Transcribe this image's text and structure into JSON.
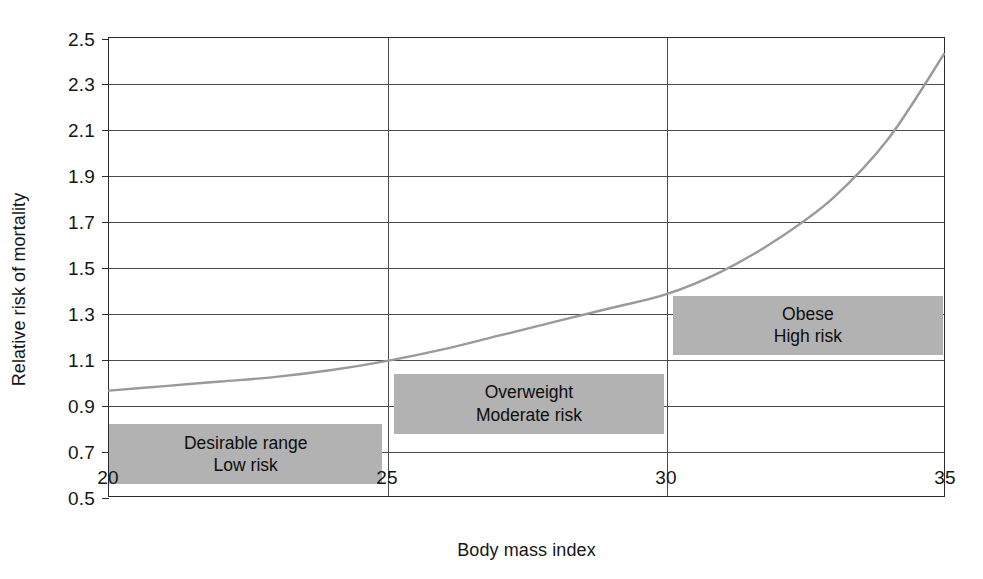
{
  "chart_data": {
    "type": "line",
    "title": "",
    "subtitle": "",
    "xlabel": "Body mass index",
    "ylabel": "Relative risk of mortality",
    "xlim": [
      20,
      35
    ],
    "ylim": [
      0.5,
      2.5
    ],
    "xticks": [
      20,
      25,
      30,
      35
    ],
    "xtick_labels": [
      "20",
      "25",
      "30",
      "35"
    ],
    "yticks": [
      0.5,
      0.7,
      0.9,
      1.1,
      1.3,
      1.5,
      1.7,
      1.9,
      2.1,
      2.3,
      2.5
    ],
    "ytick_labels": [
      "0.5",
      "0.7",
      "0.9",
      "1.1",
      "1.3",
      "1.5",
      "1.7",
      "1.9",
      "2.1",
      "2.3",
      "2.5"
    ],
    "grid": {
      "horizontal": true,
      "vertical_at": [
        25,
        30
      ],
      "color": "#4a4a4a"
    },
    "legend": null,
    "series": [
      {
        "name": "Relative risk of mortality",
        "color": "#9a9a9a",
        "line_width": 2.4,
        "x": [
          20,
          21,
          22,
          23,
          24,
          25,
          26,
          27,
          28,
          29,
          30,
          31,
          32,
          33,
          34,
          35
        ],
        "y": [
          0.96,
          0.98,
          1.0,
          1.02,
          1.05,
          1.09,
          1.14,
          1.2,
          1.26,
          1.32,
          1.38,
          1.48,
          1.62,
          1.8,
          2.06,
          2.43
        ]
      }
    ],
    "annotations": [
      {
        "name": "desirable-range",
        "lines": [
          "Desirable range",
          "Low risk"
        ],
        "x_range": [
          20,
          24.9
        ],
        "y_range": [
          0.56,
          0.82
        ],
        "fill": "#b2b2b2"
      },
      {
        "name": "overweight",
        "lines": [
          "Overweight",
          "Moderate risk"
        ],
        "x_range": [
          25.1,
          29.95
        ],
        "y_range": [
          0.78,
          1.04
        ],
        "fill": "#b2b2b2"
      },
      {
        "name": "obese",
        "lines": [
          "Obese",
          "High risk"
        ],
        "x_range": [
          30.1,
          34.95
        ],
        "y_range": [
          1.12,
          1.38
        ],
        "fill": "#b2b2b2"
      }
    ],
    "axis_color": "#2b2b2b",
    "background": "#ffffff"
  }
}
